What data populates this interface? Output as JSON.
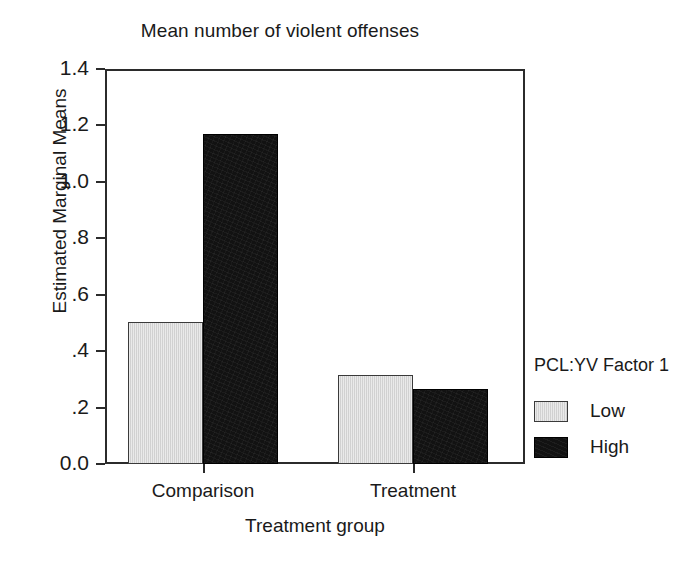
{
  "chart_data": {
    "type": "bar",
    "title": "Mean number of violent offenses",
    "xlabel": "Treatment group",
    "ylabel": "Estimated Marginal Means",
    "categories": [
      "Comparison",
      "Treatment"
    ],
    "series": [
      {
        "name": "Low",
        "values": [
          0.505,
          0.315
        ],
        "color": "#d8d8d8"
      },
      {
        "name": "High",
        "values": [
          1.17,
          0.265
        ],
        "color": "#121212"
      }
    ],
    "legend": {
      "title": "PCL:YV Factor 1",
      "position": "right",
      "entries": [
        "Low",
        "High"
      ]
    },
    "ylim": [
      0.0,
      1.4
    ],
    "ytick_values": [
      0.0,
      0.2,
      0.4,
      0.6,
      0.8,
      1.0,
      1.2,
      1.4
    ],
    "ytick_labels": [
      "0.0",
      ".2",
      ".4",
      ".6",
      ".8",
      "1.0",
      "1.2",
      "1.4"
    ],
    "grid": false
  },
  "axis": {
    "y_ticks": [
      {
        "label": "1.4",
        "value": 1.4
      },
      {
        "label": "1.2",
        "value": 1.2
      },
      {
        "label": "1.0",
        "value": 1.0
      },
      {
        "label": ".8",
        "value": 0.8
      },
      {
        "label": ".6",
        "value": 0.6
      },
      {
        "label": ".4",
        "value": 0.4
      },
      {
        "label": ".2",
        "value": 0.2
      },
      {
        "label": "0.0",
        "value": 0.0
      }
    ],
    "x_categories": [
      {
        "label": "Comparison"
      },
      {
        "label": "Treatment"
      }
    ]
  },
  "colors": {
    "low": "#d8d8d8",
    "high": "#121212",
    "axis": "#2b2b2b",
    "text": "#1a1a1a",
    "background": "#ffffff"
  }
}
